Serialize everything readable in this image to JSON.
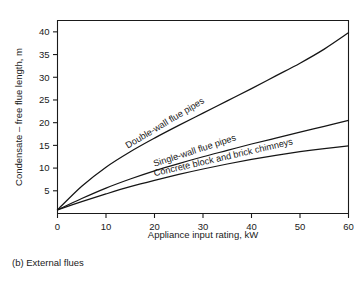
{
  "figure": {
    "caption": "(b) External flues"
  },
  "chart_data": {
    "type": "line",
    "title": "",
    "subtitle": "",
    "xlabel": "Appliance input rating, kW",
    "ylabel": "Condensate – free flue length, m",
    "xlim": [
      0,
      60
    ],
    "ylim": [
      0,
      42.5
    ],
    "xticks": [
      0,
      10,
      20,
      30,
      40,
      50,
      60
    ],
    "xtick_labels": [
      "0",
      "10",
      "20",
      "30",
      "40",
      "50",
      "60"
    ],
    "yticks": [
      5,
      10,
      15,
      20,
      25,
      30,
      35,
      40
    ],
    "ytick_labels": [
      "5",
      "10",
      "15",
      "20",
      "25",
      "30",
      "35",
      "40"
    ],
    "grid": false,
    "legend_position": "inline-curve-labels",
    "x": [
      0,
      5,
      10,
      15,
      20,
      25,
      30,
      35,
      40,
      45,
      50,
      55,
      60
    ],
    "series": [
      {
        "name": "Double-wall flue pipes",
        "label": "Double-wall flue pipes",
        "color": "#151515",
        "label_angle_deg": -31,
        "values": [
          0.8,
          6.0,
          10.2,
          13.6,
          16.6,
          19.4,
          22.1,
          24.8,
          27.5,
          30.3,
          33.1,
          36.2,
          39.8
        ]
      },
      {
        "name": "Single-wall flue pipes",
        "label": "Single-wall flue pipes",
        "color": "#151515",
        "label_angle_deg": -18,
        "values": [
          0.8,
          3.3,
          5.6,
          7.6,
          9.4,
          11.0,
          12.5,
          13.9,
          15.3,
          16.6,
          17.9,
          19.2,
          20.5
        ]
      },
      {
        "name": "Concrete block and brick chimneys",
        "label": "Concrete block and brick chimneys",
        "color": "#151515",
        "label_angle_deg": -13,
        "values": [
          0.8,
          2.6,
          4.3,
          5.9,
          7.3,
          8.6,
          9.8,
          10.9,
          11.9,
          12.8,
          13.6,
          14.3,
          14.9
        ]
      }
    ]
  }
}
